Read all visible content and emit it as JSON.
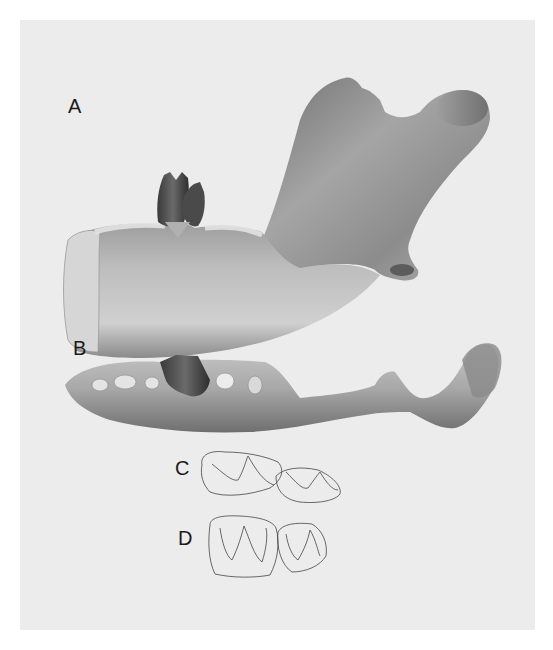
{
  "figure": {
    "background_color": "#ececec",
    "panels": [
      {
        "id": "A",
        "label": "A",
        "view": "lateral view of hemimandible with two teeth in place"
      },
      {
        "id": "B",
        "label": "B",
        "view": "occlusal/dorsal view of hemimandible with teeth and alveoli"
      },
      {
        "id": "C",
        "label": "C",
        "view": "line drawing of two molar crowns, occlusal outline"
      },
      {
        "id": "D",
        "label": "D",
        "view": "line drawing of two molar crowns, alternative view"
      }
    ]
  }
}
